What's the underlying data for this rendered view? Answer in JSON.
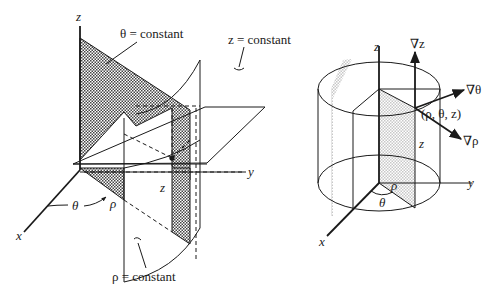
{
  "figure_left": {
    "axes": {
      "x": "x",
      "y": "y",
      "z": "z"
    },
    "surfaces": {
      "theta_constant": "θ = constant",
      "z_constant": "z = constant",
      "rho_constant": "ρ = constant"
    },
    "annotations": {
      "theta": "θ",
      "rho": "ρ",
      "z": "z"
    }
  },
  "figure_right": {
    "axes": {
      "x": "x",
      "y": "y",
      "z": "z"
    },
    "point_label": "(ρ, θ, z)",
    "gradients": {
      "grad_z": "∇z",
      "grad_theta": "∇θ",
      "grad_rho": "∇ρ"
    },
    "annotations": {
      "theta": "θ",
      "rho": "ρ",
      "z": "z"
    }
  },
  "colors": {
    "ink": "#1a1a1a",
    "shade": "#8a8a8a",
    "light_shade": "#d9d9d9"
  }
}
